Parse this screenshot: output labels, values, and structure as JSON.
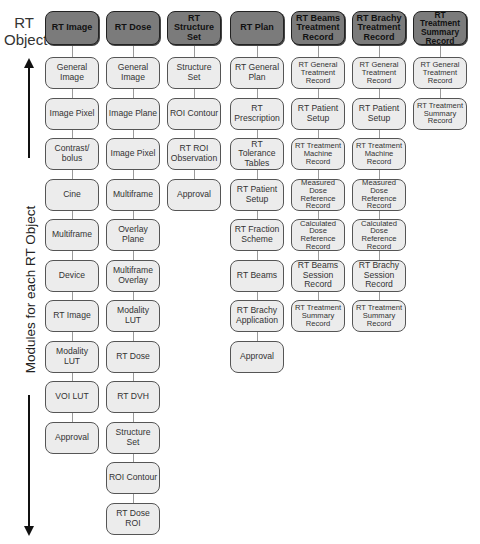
{
  "axis": {
    "object_label": "RT Object",
    "object_label_lines": [
      "RT",
      "Object"
    ],
    "modules_label": "Modules for each RT Object"
  },
  "columns": [
    {
      "header": "RT Image",
      "modules": [
        "General Image",
        "Image Pixel",
        "Contrast/ bolus",
        "Cine",
        "Multiframe",
        "Device",
        "RT Image",
        "Modality LUT",
        "VOI LUT",
        "Approval"
      ]
    },
    {
      "header": "RT Dose",
      "modules": [
        "General Image",
        "Image Plane",
        "Image Pixel",
        "Multiframe",
        "Overlay Plane",
        "Multiframe Overlay",
        "Modality LUT",
        "RT Dose",
        "RT DVH",
        "Structure Set",
        "ROI Contour",
        "RT Dose ROI"
      ]
    },
    {
      "header": "RT Structure Set",
      "modules": [
        "Structure Set",
        "ROI Contour",
        "RT ROI Observation",
        "Approval"
      ]
    },
    {
      "header": "RT Plan",
      "modules": [
        "RT General Plan",
        "RT Prescription",
        "RT Tolerance Tables",
        "RT Patient Setup",
        "RT Fraction Scheme",
        "RT Beams",
        "RT Brachy Application",
        "Approval"
      ]
    },
    {
      "header": "RT Beams Treatment Record",
      "modules": [
        "RT General Treatment Record",
        "RT Patient Setup",
        "RT Treatment Machine Record",
        "Measured Dose Reference Record",
        "Calculated Dose Reference Record",
        "RT Beams Session Record",
        "RT Treatment Summary Record"
      ]
    },
    {
      "header": "RT Brachy Treatment Record",
      "modules": [
        "RT General Treatment Record",
        "RT Patient Setup",
        "RT Treatment Machine Record",
        "Measured Dose Reference Record",
        "Calculated Dose Reference Record",
        "RT Brachy Session Record",
        "RT Treatment Summary Record"
      ]
    },
    {
      "header": "RT Treatment Summary Record",
      "modules": [
        "RT General Treatment Record",
        "RT Treatment Summary Record"
      ]
    }
  ],
  "colors": {
    "header_fill": "#7b7b7b",
    "module_fill": "#ececec",
    "border": "#555555",
    "connector": "#9a9a9a"
  }
}
